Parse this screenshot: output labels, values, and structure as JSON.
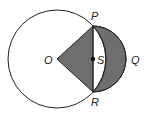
{
  "diagram": {
    "labels": {
      "P": "P",
      "Q": "Q",
      "R": "R",
      "O": "O",
      "S": "S"
    },
    "colors": {
      "shade": "#6e6e6e",
      "stroke": "#222222",
      "background": "#ffffff"
    }
  }
}
